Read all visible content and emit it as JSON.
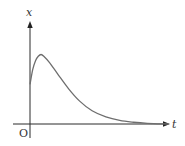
{
  "chart_data": {
    "type": "line",
    "title": "",
    "xlabel": "t",
    "ylabel": "x",
    "origin_label": "O",
    "grid": false,
    "legend": null,
    "series": [
      {
        "name": "x(t)",
        "points_normalized": [
          [
            0.0,
            0.45
          ],
          [
            0.02,
            0.62
          ],
          [
            0.04,
            0.72
          ],
          [
            0.06,
            0.77
          ],
          [
            0.08,
            0.79
          ],
          [
            0.1,
            0.77
          ],
          [
            0.14,
            0.7
          ],
          [
            0.2,
            0.57
          ],
          [
            0.28,
            0.4
          ],
          [
            0.36,
            0.26
          ],
          [
            0.45,
            0.15
          ],
          [
            0.55,
            0.08
          ],
          [
            0.65,
            0.04
          ],
          [
            0.75,
            0.02
          ],
          [
            0.85,
            0.008
          ],
          [
            1.0,
            0.0
          ]
        ]
      }
    ],
    "axes": {
      "x_arrow": true,
      "y_arrow": true
    },
    "colors": {
      "axis": "#2a2a2a",
      "curve": "#6e6e6e",
      "background": "#ffffff"
    }
  }
}
